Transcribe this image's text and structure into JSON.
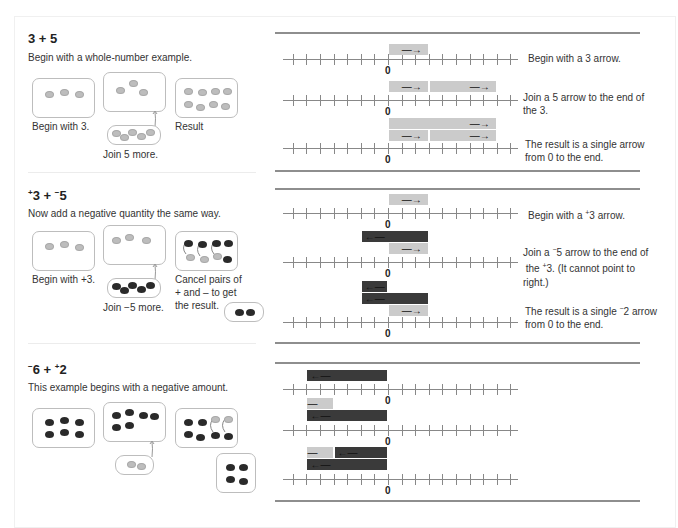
{
  "sections": [
    {
      "title": "3 + 5",
      "subtitle": "Begin with a whole-number example.",
      "captions": {
        "begin": "Begin with 3.",
        "join": "Join 5 more.",
        "result": "Result"
      },
      "number_lines": [
        {
          "arrows": [
            {
              "from": 0,
              "to": 3,
              "sign": "pos"
            }
          ],
          "note": "Begin with a 3 arrow."
        },
        {
          "arrows": [
            {
              "from": 0,
              "to": 3,
              "sign": "pos"
            },
            {
              "from": 3,
              "to": 8,
              "sign": "pos"
            }
          ],
          "note": "Join a 5 arrow to the end of the 3."
        },
        {
          "arrows": [
            {
              "from": 0,
              "to": 8,
              "sign": "pos"
            },
            {
              "from": 0,
              "to": 3,
              "sign": "pos"
            },
            {
              "from": 3,
              "to": 8,
              "sign": "pos"
            }
          ],
          "note": "The result is a single arrow from 0 to the end."
        }
      ]
    },
    {
      "title": "+3 + −5",
      "subtitle": "Now add a negative quantity the same way.",
      "captions": {
        "begin": "Begin with +3.",
        "join": "Join −5 more.",
        "cancel": "Cancel pairs of + and – to get the result."
      },
      "number_lines": [
        {
          "arrows": [
            {
              "from": 0,
              "to": 3,
              "sign": "pos"
            }
          ],
          "note": "Begin with a +3 arrow."
        },
        {
          "arrows": [
            {
              "from": 3,
              "to": -2,
              "sign": "neg"
            },
            {
              "from": 0,
              "to": 3,
              "sign": "pos"
            }
          ],
          "note": "Join a −5 arrow to the end of  the +3. (It cannot point to right.)"
        },
        {
          "arrows": [
            {
              "from": 0,
              "to": -2,
              "sign": "neg"
            },
            {
              "from": 3,
              "to": -2,
              "sign": "neg"
            },
            {
              "from": 0,
              "to": 3,
              "sign": "pos"
            }
          ],
          "note": "The result is a single −2 arrow from 0 to the end."
        }
      ]
    },
    {
      "title": "−6 + +2",
      "subtitle": "This example begins with a negative amount.",
      "number_lines": [
        {
          "arrows": [
            {
              "from": 0,
              "to": -6,
              "sign": "neg"
            }
          ],
          "note": ""
        },
        {
          "arrows": [
            {
              "from": -6,
              "to": -4,
              "sign": "pos"
            },
            {
              "from": 0,
              "to": -6,
              "sign": "neg"
            }
          ],
          "note": ""
        },
        {
          "arrows": [
            {
              "from": -6,
              "to": -4,
              "sign": "pos"
            },
            {
              "from": 0,
              "to": -4,
              "sign": "neg"
            },
            {
              "from": 0,
              "to": -6,
              "sign": "neg"
            }
          ],
          "note": ""
        }
      ]
    }
  ],
  "number_line": {
    "min": -7,
    "max": 9,
    "zero_label": "0"
  },
  "colors": {
    "positive": "#cbcbcb",
    "negative": "#3a3a3a",
    "axis": "#888888"
  }
}
